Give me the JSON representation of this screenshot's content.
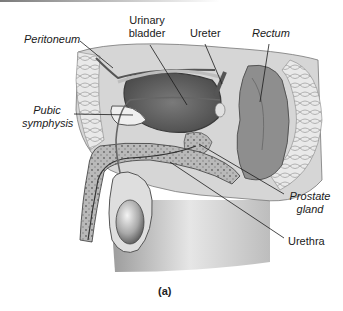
{
  "figure": {
    "caption": "(a)",
    "labels": {
      "peritoneum": "Peritoneum",
      "urinary_bladder_line1": "Urinary",
      "urinary_bladder_line2": "bladder",
      "ureter": "Ureter",
      "rectum": "Rectum",
      "pubic_symphysis_line1": "Pubic",
      "pubic_symphysis_line2": "symphysis",
      "prostate_gland_line1": "Prostate",
      "prostate_gland_line2": "gland",
      "urethra": "Urethra"
    },
    "colors": {
      "ink": "#1a1a1a",
      "tissue_dark": "#5a5a5a",
      "tissue_mid": "#8c8c8c",
      "tissue_light": "#c8c8c8",
      "skin": "#e2e2e2",
      "background": "#ffffff"
    }
  }
}
